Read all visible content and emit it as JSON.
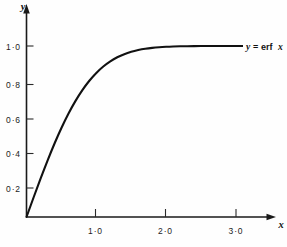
{
  "figure": {
    "background_color": "#fefefe",
    "ink_color": "#111111"
  },
  "chart_data": {
    "type": "line",
    "title": "",
    "subtitle": "",
    "xlabel": "x",
    "ylabel": "y",
    "xlim": [
      0,
      3.35
    ],
    "ylim": [
      0,
      1.12
    ],
    "grid": false,
    "legend_position": "inline-right",
    "annotations": [
      {
        "name": "curve-label",
        "text_italic_1": "y",
        "text_equals": "=",
        "text_roman": "erf",
        "text_italic_2": "x",
        "full_text": "y = erf x",
        "x": 3.0,
        "y": 1.0
      }
    ],
    "xticks": [
      1.0,
      2.0,
      3.0
    ],
    "xticklabels": [
      "1·0",
      "2·0",
      "3·0"
    ],
    "yticks": [
      0.2,
      0.4,
      0.6,
      0.8,
      1.0
    ],
    "yticklabels": [
      "0·2",
      "0·4",
      "0·6",
      "0·8",
      "1·0"
    ],
    "series": [
      {
        "name": "y = erf x",
        "color": "#111111",
        "x": [
          0.0,
          0.1,
          0.2,
          0.3,
          0.4,
          0.5,
          0.6,
          0.7,
          0.8,
          0.9,
          1.0,
          1.1,
          1.2,
          1.3,
          1.4,
          1.5,
          1.6,
          1.7,
          1.8,
          1.9,
          2.0,
          2.1,
          2.2,
          2.3,
          2.4,
          2.5,
          2.6,
          2.7,
          2.8,
          2.9,
          3.0
        ],
        "values": [
          0.0,
          0.1125,
          0.2227,
          0.3286,
          0.4284,
          0.5205,
          0.6039,
          0.6778,
          0.7421,
          0.7969,
          0.8427,
          0.8802,
          0.9103,
          0.934,
          0.9523,
          0.9661,
          0.9763,
          0.9838,
          0.9891,
          0.9928,
          0.9953,
          0.997,
          0.9981,
          0.9989,
          0.9993,
          0.9996,
          0.9998,
          0.9999,
          0.9999,
          1.0,
          1.0
        ]
      }
    ]
  },
  "axes": {
    "y_axis_label": "y",
    "x_axis_label": "x",
    "y_tick_labels": [
      "1·0",
      "0·8",
      "0·6",
      "0·4",
      "0·2"
    ],
    "x_tick_labels": [
      "1·0",
      "2·0",
      "3·0"
    ]
  },
  "curve_label": {
    "y_sym": "y",
    "eq": "=",
    "erf": "erf",
    "x_sym": "x"
  }
}
